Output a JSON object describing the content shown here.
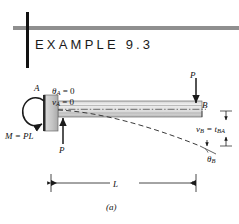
{
  "header": {
    "title_plain": "EXAMPLE 9.3",
    "rule_color": "#8f8f8f",
    "bar_color": "#111111"
  },
  "figure": {
    "caption": "(a)",
    "beam_fill_top": "#d9d9d9",
    "beam_fill_mid": "#f2f2f2",
    "beam_fill_bottom": "#bfbfbf",
    "support_fill": "#c9c9c9",
    "line_color": "#1a1a1a",
    "labels": {
      "point_a": "A",
      "point_b": "B",
      "theta_a": "θ",
      "theta_a_sub": "A",
      "theta_a_val": " = 0",
      "v_a": "v",
      "v_a_sub": "A",
      "v_a_val": " = 0",
      "moment": "M = PL",
      "force_left": "P",
      "force_top": "P",
      "v_b": "v",
      "v_b_sub": "B",
      "v_b_eq": " = t",
      "v_b_sub2": "BA",
      "theta_b": "θ",
      "theta_b_sub": "B",
      "length": "L"
    }
  }
}
